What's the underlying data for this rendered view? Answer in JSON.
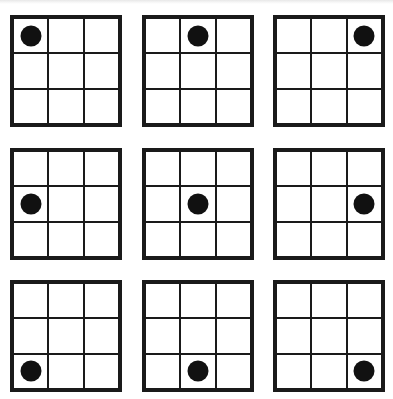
{
  "figure": {
    "line_color": "#1a1a1a",
    "dot_color": "#111111",
    "background": "#ffffff",
    "grids": [
      {
        "row": 0,
        "col": 0,
        "dot_cell": {
          "row": 0,
          "col": 0
        }
      },
      {
        "row": 0,
        "col": 1,
        "dot_cell": {
          "row": 0,
          "col": 1
        }
      },
      {
        "row": 0,
        "col": 2,
        "dot_cell": {
          "row": 0,
          "col": 2
        }
      },
      {
        "row": 1,
        "col": 0,
        "dot_cell": {
          "row": 1,
          "col": 0
        }
      },
      {
        "row": 1,
        "col": 1,
        "dot_cell": {
          "row": 1,
          "col": 1
        }
      },
      {
        "row": 1,
        "col": 2,
        "dot_cell": {
          "row": 1,
          "col": 2
        }
      },
      {
        "row": 2,
        "col": 0,
        "dot_cell": {
          "row": 2,
          "col": 0
        }
      },
      {
        "row": 2,
        "col": 1,
        "dot_cell": {
          "row": 2,
          "col": 1
        }
      },
      {
        "row": 2,
        "col": 2,
        "dot_cell": {
          "row": 2,
          "col": 2
        }
      }
    ]
  }
}
